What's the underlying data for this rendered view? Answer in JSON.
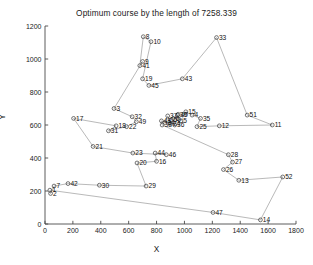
{
  "chart_data": {
    "type": "scatter",
    "title": "Optimum course by the length of 7258.339",
    "xlabel": "X",
    "ylabel": "Y",
    "xlim": [
      0,
      1800
    ],
    "ylim": [
      0,
      1200
    ],
    "xticks": [
      0,
      200,
      400,
      600,
      800,
      1000,
      1200,
      1400,
      1600,
      1800
    ],
    "yticks": [
      0,
      200,
      400,
      600,
      800,
      1000,
      1200
    ],
    "grid": false,
    "legend": null,
    "tour_length": "7258.339",
    "marker": "circle",
    "point_color": "#3a3a3a",
    "line_color": "#8a8a8a",
    "nodes": [
      {
        "id": "1",
        "x": 35,
        "y": 205
      },
      {
        "id": "2",
        "x": 40,
        "y": 185
      },
      {
        "id": "3",
        "x": 495,
        "y": 700
      },
      {
        "id": "4",
        "x": 1055,
        "y": 660
      },
      {
        "id": "5",
        "x": 975,
        "y": 625
      },
      {
        "id": "7",
        "x": 65,
        "y": 230
      },
      {
        "id": "8",
        "x": 705,
        "y": 1135
      },
      {
        "id": "9",
        "x": 700,
        "y": 985
      },
      {
        "id": "10",
        "x": 760,
        "y": 1105
      },
      {
        "id": "11",
        "x": 1630,
        "y": 600
      },
      {
        "id": "12",
        "x": 1250,
        "y": 595
      },
      {
        "id": "13",
        "x": 1390,
        "y": 265
      },
      {
        "id": "14",
        "x": 1545,
        "y": 25
      },
      {
        "id": "15",
        "x": 1010,
        "y": 680
      },
      {
        "id": "16",
        "x": 800,
        "y": 380
      },
      {
        "id": "17",
        "x": 205,
        "y": 640
      },
      {
        "id": "18",
        "x": 510,
        "y": 595
      },
      {
        "id": "19",
        "x": 700,
        "y": 880
      },
      {
        "id": "20",
        "x": 660,
        "y": 370
      },
      {
        "id": "21",
        "x": 345,
        "y": 470
      },
      {
        "id": "22",
        "x": 585,
        "y": 590
      },
      {
        "id": "23",
        "x": 630,
        "y": 430
      },
      {
        "id": "25",
        "x": 1090,
        "y": 590
      },
      {
        "id": "26",
        "x": 1280,
        "y": 330
      },
      {
        "id": "27",
        "x": 1345,
        "y": 375
      },
      {
        "id": "28",
        "x": 1315,
        "y": 420
      },
      {
        "id": "29",
        "x": 725,
        "y": 230
      },
      {
        "id": "30",
        "x": 390,
        "y": 235
      },
      {
        "id": "31",
        "x": 455,
        "y": 565
      },
      {
        "id": "32",
        "x": 625,
        "y": 650
      },
      {
        "id": "33",
        "x": 1230,
        "y": 1130
      },
      {
        "id": "35",
        "x": 1115,
        "y": 640
      },
      {
        "id": "41",
        "x": 680,
        "y": 960
      },
      {
        "id": "42",
        "x": 165,
        "y": 245
      },
      {
        "id": "43",
        "x": 985,
        "y": 880
      },
      {
        "id": "44",
        "x": 790,
        "y": 430
      },
      {
        "id": "45",
        "x": 745,
        "y": 840
      },
      {
        "id": "46",
        "x": 870,
        "y": 420
      },
      {
        "id": "47",
        "x": 1205,
        "y": 70
      },
      {
        "id": "49",
        "x": 655,
        "y": 620
      },
      {
        "id": "51",
        "x": 1450,
        "y": 660
      },
      {
        "id": "52",
        "x": 1705,
        "y": 285
      },
      {
        "id": "6",
        "x": 920,
        "y": 640
      },
      {
        "id": "24",
        "x": 900,
        "y": 610
      },
      {
        "id": "34",
        "x": 860,
        "y": 615
      },
      {
        "id": "36",
        "x": 930,
        "y": 600
      },
      {
        "id": "37",
        "x": 880,
        "y": 655
      },
      {
        "id": "38",
        "x": 840,
        "y": 600
      },
      {
        "id": "39",
        "x": 950,
        "y": 660
      },
      {
        "id": "40",
        "x": 955,
        "y": 665
      },
      {
        "id": "48",
        "x": 835,
        "y": 625
      },
      {
        "id": "50",
        "x": 905,
        "y": 630
      }
    ],
    "tour": [
      "1",
      "2",
      "7",
      "42",
      "30",
      "29",
      "20",
      "16",
      "44",
      "46",
      "23",
      "21",
      "17",
      "18",
      "31",
      "22",
      "49",
      "32",
      "3",
      "9",
      "41",
      "8",
      "10",
      "19",
      "45",
      "43",
      "33",
      "51",
      "11",
      "12",
      "25",
      "35",
      "4",
      "15",
      "5",
      "39",
      "40",
      "36",
      "6",
      "50",
      "24",
      "37",
      "34",
      "48",
      "38",
      "28",
      "27",
      "26",
      "13",
      "52",
      "14",
      "47",
      "1"
    ]
  }
}
